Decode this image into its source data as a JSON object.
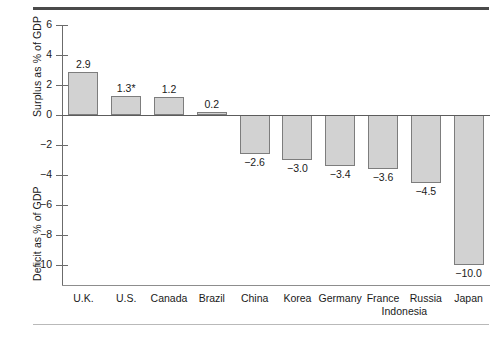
{
  "chart_data": {
    "type": "bar",
    "title": "",
    "subtitle": "",
    "xlabel": "",
    "ylabel_top": "Surplus as % of GDP",
    "ylabel_bottom": "Deficit as % of GDP",
    "categories": [
      "U.K.",
      "U.S.",
      "Canada",
      "Brazil",
      "China",
      "Korea",
      "Germany",
      "France",
      "Indonesia",
      "Russia",
      "Japan"
    ],
    "values": [
      2.9,
      1.3,
      1.2,
      0.2,
      -2.6,
      -3.0,
      -3.4,
      -3.6,
      -3.7,
      -4.5,
      -10.0
    ],
    "value_labels": [
      "2.9",
      "1.3*",
      "1.2",
      "0.2",
      "−2.6",
      "−3.0",
      "−3.4",
      "−3.6",
      "−3.7",
      "−4.5",
      "−10.0"
    ],
    "ylim": [
      -11,
      6
    ],
    "yticks": [
      6,
      4,
      2,
      0,
      -2,
      -4,
      -6,
      -8,
      -10
    ],
    "ytick_labels": [
      "6",
      "4",
      "2",
      "0",
      "−2",
      "−4",
      "−6",
      "−8",
      "−10"
    ],
    "grid": false,
    "legend": "none",
    "bar_color": "#d2d2d2",
    "bar_edge_color": "#7d7d7d"
  }
}
